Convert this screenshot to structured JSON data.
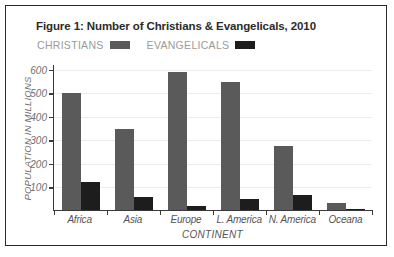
{
  "figure": {
    "title": "Figure 1: Number of Christians & Evangelicals, 2010"
  },
  "legend": {
    "entries": [
      {
        "label": "CHRISTIANS",
        "color": "#5a5a5a",
        "swatch_name": "legend-swatch-christians"
      },
      {
        "label": "EVANGELICALS",
        "color": "#1d1d1d",
        "swatch_name": "legend-swatch-evangelicals"
      }
    ]
  },
  "colors": {
    "christians": "#5a5a5a",
    "evangelicals": "#1d1d1d",
    "gridline": "#ececec",
    "axis": "#3a3a3a",
    "title_text": "#2b2b2b",
    "legend_text": "#9a9a9a",
    "tick_text": "#6f6f6f",
    "frame": "#2b2b2b"
  },
  "chart_data": {
    "type": "bar",
    "title": "Figure 1: Number of Christians & Evangelicals, 2010",
    "xlabel": "CONTINENT",
    "ylabel": "POPULATION IN MILLIONS",
    "categories": [
      "Africa",
      "Asia",
      "Europe",
      "L. America",
      "N. America",
      "Oceana"
    ],
    "series": [
      {
        "name": "CHRISTIANS",
        "color": "#5a5a5a",
        "values": [
          495,
          345,
          585,
          545,
          270,
          28
        ]
      },
      {
        "name": "EVANGELICALS",
        "color": "#1d1d1d",
        "values": [
          120,
          55,
          15,
          48,
          62,
          4
        ]
      }
    ],
    "ylim": [
      0,
      620
    ],
    "yticks": [
      100,
      200,
      300,
      400,
      500,
      600
    ],
    "ytick_labels": [
      "100",
      "200",
      "300",
      "400",
      "500",
      "600"
    ],
    "grid": true,
    "legend_position": "top-left-under-title"
  }
}
